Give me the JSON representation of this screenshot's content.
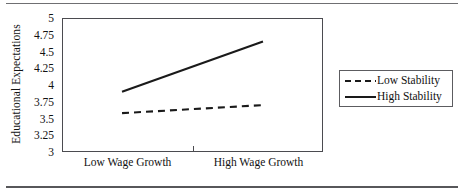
{
  "chart_data": {
    "type": "line",
    "title": "",
    "subtitle": "",
    "xlabel": "",
    "ylabel": "Educational Expectations",
    "categories": [
      "Low Wage Growth",
      "High Wage Growth"
    ],
    "x": [
      0,
      1
    ],
    "series": [
      {
        "name": "Low Stability",
        "style": "dashed",
        "values": [
          3.58,
          3.7
        ]
      },
      {
        "name": "High Stability",
        "style": "solid",
        "values": [
          3.9,
          4.65
        ]
      }
    ],
    "ylim": [
      3,
      5
    ],
    "yticks": [
      3,
      3.25,
      3.5,
      3.75,
      4,
      4.25,
      4.5,
      4.75,
      5
    ],
    "ytick_labels": [
      "3",
      "3.25",
      "3.5",
      "3.75",
      "4",
      "4.25",
      "4.5",
      "4.75",
      "5"
    ],
    "grid": false,
    "legend_position": "right-outside",
    "line_color": "#1a1a1a"
  },
  "axis": {
    "y_title": "Educational Expectations",
    "y_tick_labels": [
      "5",
      "4.75",
      "4.5",
      "4.25",
      "4",
      "3.75",
      "3.5",
      "3.25",
      "3"
    ],
    "x_tick_labels": [
      "Low Wage Growth",
      "High Wage Growth"
    ]
  },
  "legend": {
    "items": [
      {
        "label": "Low Stability",
        "swatch": "dashed-line-swatch"
      },
      {
        "label": "High Stability",
        "swatch": "solid-line-swatch"
      }
    ]
  }
}
